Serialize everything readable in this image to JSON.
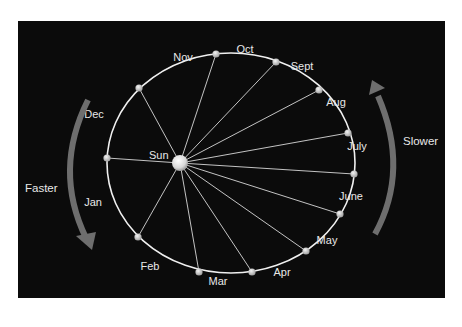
{
  "diagram": {
    "sun_label": "Sun",
    "months": [
      {
        "label": "Nov",
        "x": 183,
        "y": 61
      },
      {
        "label": "Oct",
        "x": 245,
        "y": 53
      },
      {
        "label": "Sept",
        "x": 302,
        "y": 70
      },
      {
        "label": "Aug",
        "x": 336,
        "y": 106
      },
      {
        "label": "July",
        "x": 357,
        "y": 150
      },
      {
        "label": "June",
        "x": 351,
        "y": 200
      },
      {
        "label": "May",
        "x": 327,
        "y": 244
      },
      {
        "label": "Apr",
        "x": 282,
        "y": 276
      },
      {
        "label": "Mar",
        "x": 218,
        "y": 285
      },
      {
        "label": "Feb",
        "x": 150,
        "y": 270
      },
      {
        "label": "Jan",
        "x": 93,
        "y": 206
      },
      {
        "label": "Dec",
        "x": 94,
        "y": 118
      }
    ],
    "orbit_points": [
      {
        "x": 216,
        "y": 54
      },
      {
        "x": 276,
        "y": 62
      },
      {
        "x": 319,
        "y": 90
      },
      {
        "x": 348,
        "y": 133
      },
      {
        "x": 354,
        "y": 174
      },
      {
        "x": 340,
        "y": 214
      },
      {
        "x": 306,
        "y": 251
      },
      {
        "x": 252,
        "y": 272
      },
      {
        "x": 199,
        "y": 272
      },
      {
        "x": 138,
        "y": 237
      },
      {
        "x": 107,
        "y": 158
      },
      {
        "x": 139,
        "y": 88
      }
    ],
    "left_arrow_label": "Faster",
    "right_arrow_label": "Slower",
    "colors": {
      "background": "#0b0b0b",
      "orbit": "#f0f0f0",
      "arrow": "#6e6e6e",
      "text": "#e8e8e8"
    }
  }
}
